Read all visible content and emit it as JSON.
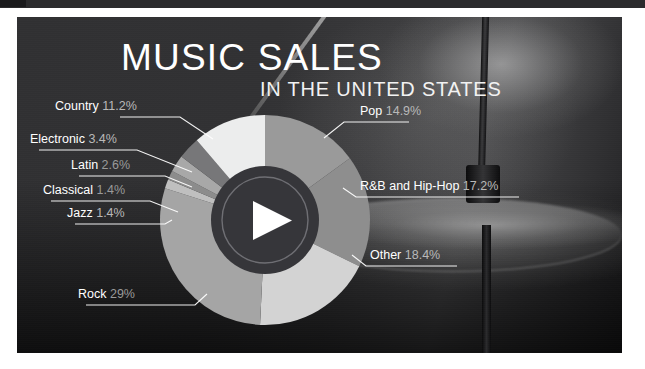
{
  "header": {
    "title": "MUSIC SALES",
    "subtitle": "IN THE UNITED STATES"
  },
  "center": {
    "icon": "play-icon"
  },
  "colors": {
    "panel_background": "#303032",
    "text_primary": "#ffffff",
    "text_secondary": "#b9b9b9",
    "leader_line": "#ffffff"
  },
  "chart_data": {
    "type": "pie",
    "title": "MUSIC SALES",
    "subtitle": "IN THE UNITED STATES",
    "unit": "percent",
    "legend": "callout labels with leader lines",
    "categories": [
      "Pop",
      "R&B and Hip-Hop",
      "Other",
      "Rock",
      "Jazz",
      "Classical",
      "Latin",
      "Electronic",
      "Country"
    ],
    "values": [
      14.9,
      17.2,
      18.4,
      29,
      1.4,
      1.4,
      2.6,
      3.4,
      11.2
    ],
    "slice_colors": [
      "#9a9a9a",
      "#8e8e8e",
      "#d3d3d3",
      "#a5a5a5",
      "#bfbfbf",
      "#8c8c8c",
      "#a8a8a8",
      "#777779",
      "#eceded"
    ],
    "slices": [
      {
        "name": "Pop",
        "value": 14.9,
        "label": "Pop",
        "percent_text": "14.9%",
        "color": "#9a9a9a"
      },
      {
        "name": "R&B and Hip-Hop",
        "value": 17.2,
        "label": "R&B and Hip-Hop",
        "percent_text": "17.2%",
        "color": "#8e8e8e"
      },
      {
        "name": "Other",
        "value": 18.4,
        "label": "Other",
        "percent_text": "18.4%",
        "color": "#d3d3d3"
      },
      {
        "name": "Rock",
        "value": 29,
        "label": "Rock",
        "percent_text": "29%",
        "color": "#a5a5a5"
      },
      {
        "name": "Jazz",
        "value": 1.4,
        "label": "Jazz",
        "percent_text": "1.4%",
        "color": "#bfbfbf"
      },
      {
        "name": "Classical",
        "value": 1.4,
        "label": "Classical",
        "percent_text": "1.4%",
        "color": "#8c8c8c"
      },
      {
        "name": "Latin",
        "value": 2.6,
        "label": "Latin",
        "percent_text": "2.6%",
        "color": "#a8a8a8"
      },
      {
        "name": "Electronic",
        "value": 3.4,
        "label": "Electronic",
        "percent_text": "3.4%",
        "color": "#777779"
      },
      {
        "name": "Country",
        "value": 11.2,
        "label": "Country",
        "percent_text": "11.2%",
        "color": "#eceded"
      }
    ]
  },
  "labels": {
    "country": {
      "name": "Country",
      "percent": "11.2%"
    },
    "electronic": {
      "name": "Electronic",
      "percent": "3.4%"
    },
    "latin": {
      "name": "Latin",
      "percent": "2.6%"
    },
    "classical": {
      "name": "Classical",
      "percent": "1.4%"
    },
    "jazz": {
      "name": "Jazz",
      "percent": "1.4%"
    },
    "rock": {
      "name": "Rock",
      "percent": "29%"
    },
    "pop": {
      "name": "Pop",
      "percent": "14.9%"
    },
    "rnb": {
      "name": "R&B and Hip-Hop",
      "percent": "17.2%"
    },
    "other": {
      "name": "Other",
      "percent": "18.4%"
    }
  }
}
